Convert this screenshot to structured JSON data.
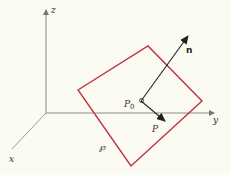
{
  "diagram": {
    "axes": {
      "x_label": "x",
      "y_label": "y",
      "z_label": "z"
    },
    "points": {
      "p0_label": "P",
      "p0_subscript": "0",
      "p_label": "P"
    },
    "vectors": {
      "normal_label": "n"
    },
    "plane": {
      "label": "℘"
    },
    "colors": {
      "axis": "#8a8a8a",
      "plane": "#c0323a",
      "vector": "#222222",
      "background": "#fbfaf3"
    }
  }
}
